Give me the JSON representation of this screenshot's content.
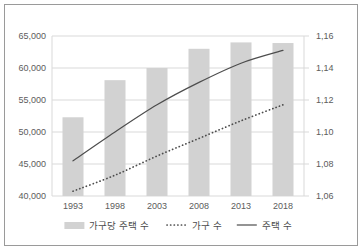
{
  "chart_data": {
    "type": "bar",
    "title": "",
    "xlabel": "",
    "ylabel": "",
    "grid": true,
    "legend_position": "bottom",
    "categories": [
      "1993",
      "1998",
      "2003",
      "2008",
      "2013",
      "2018"
    ],
    "left_axis": {
      "label": "",
      "ylim": [
        40000,
        65000
      ],
      "ticks": [
        "40,000",
        "45,000",
        "50,000",
        "55,000",
        "60,000",
        "65,000"
      ],
      "tick_values": [
        40000,
        45000,
        50000,
        55000,
        60000,
        65000
      ]
    },
    "right_axis": {
      "label": "",
      "ylim": [
        1.06,
        1.16
      ],
      "ticks": [
        "1,06",
        "1,08",
        "1,10",
        "1,12",
        "1,14",
        "1,16"
      ],
      "tick_values": [
        1.06,
        1.08,
        1.1,
        1.12,
        1.14,
        1.16
      ]
    },
    "series": [
      {
        "name": "가구당 주택 수",
        "kind": "bar",
        "axis": "left",
        "color": "#d2d2d2",
        "values": [
          52300,
          58100,
          60000,
          63000,
          64000,
          63900
        ]
      },
      {
        "name": "가구 수",
        "kind": "dotted-line",
        "axis": "right",
        "color": "#4d4d4d",
        "values": [
          1.063,
          1.073,
          1.085,
          1.096,
          1.107,
          1.117
        ]
      },
      {
        "name": "주택 수",
        "kind": "solid-line",
        "axis": "right",
        "color": "#4d4d4d",
        "values": [
          1.082,
          1.1,
          1.117,
          1.131,
          1.143,
          1.151
        ]
      }
    ]
  },
  "legend": {
    "items": [
      {
        "label": "가구당 주택 수",
        "marker": "bar-swatch"
      },
      {
        "label": "가구 수",
        "marker": "dotted-line-swatch"
      },
      {
        "label": "주택 수",
        "marker": "solid-line-swatch"
      }
    ]
  },
  "colors": {
    "bar_fill": "#d2d2d2",
    "line": "#4d4d4d",
    "grid": "#d9d9d9",
    "axis_text": "#5c5c5c",
    "frame_border": "#9a9a9a"
  }
}
